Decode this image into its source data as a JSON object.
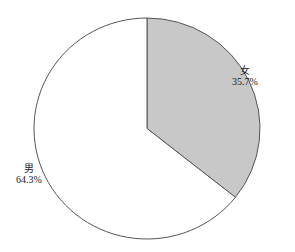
{
  "chart_data": {
    "type": "pie",
    "title": "",
    "categories": [
      "女",
      "男"
    ],
    "values": [
      35.7,
      64.3
    ],
    "labels": [
      "女\n35.7%",
      "男\n64.3%"
    ],
    "colors": [
      "#c8c8c8",
      "#ffffff"
    ],
    "start_angle_deg": 90,
    "direction": "clockwise",
    "legend": "none"
  },
  "slices": [
    {
      "name": "女",
      "percent": "35.7%",
      "fill": "#c8c8c8"
    },
    {
      "name": "男",
      "percent": "64.3%",
      "fill": "#ffffff"
    }
  ]
}
